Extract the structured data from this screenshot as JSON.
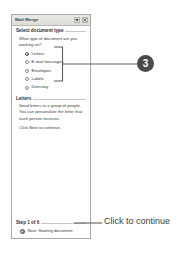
{
  "taskpane": {
    "title": "Mail Merge",
    "titlebar_buttons": [
      {
        "name": "dropdown-arrow",
        "glyph": "▾"
      },
      {
        "name": "close",
        "glyph": "✕"
      }
    ],
    "section_document_type": {
      "heading": "Select document type",
      "prompt": "What type of document are you working on?",
      "options": [
        {
          "label": "Letters",
          "checked": true
        },
        {
          "label": "E-mail messages",
          "checked": false
        },
        {
          "label": "Envelopes",
          "checked": false
        },
        {
          "label": "Labels",
          "checked": false
        },
        {
          "label": "Directory",
          "checked": false
        }
      ]
    },
    "section_letters": {
      "heading": "Letters",
      "description": "Send letters to a group of people. You can personalize the letter that each person receives.",
      "hint": "Click Next to continue."
    },
    "step_area": {
      "heading": "Step 1 of 6",
      "next_label": "Next: Starting document"
    }
  },
  "annotations": {
    "badge_number": "3",
    "callout_text": "Click to continue"
  },
  "colors": {
    "badge_fill": "#4a4a48",
    "pane_border": "#a8a8a4",
    "leader_line": "#5e5e5c"
  }
}
